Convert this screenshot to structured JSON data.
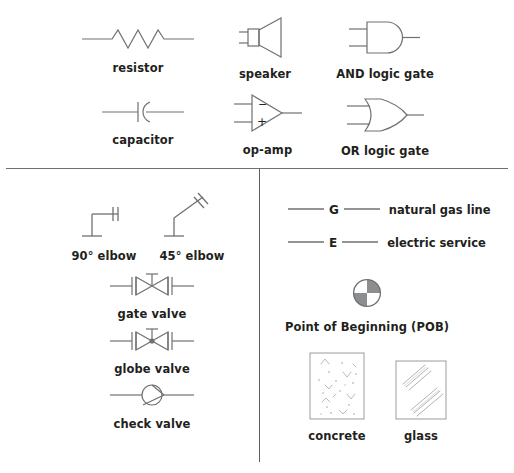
{
  "figure": {
    "stroke_color": "#6f7072",
    "text_color": "#231f20",
    "fill_gray": "#8d8e90",
    "background": "#ffffff"
  },
  "sections": {
    "electrical": {
      "name": "electrical symbols",
      "items": [
        {
          "id": "resistor",
          "label": "resistor",
          "icon": "resistor-symbol"
        },
        {
          "id": "speaker",
          "label": "speaker",
          "icon": "speaker-symbol"
        },
        {
          "id": "and_gate",
          "label": "AND logic gate",
          "icon": "and-gate-symbol"
        },
        {
          "id": "capacitor",
          "label": "capacitor",
          "icon": "capacitor-symbol"
        },
        {
          "id": "op_amp",
          "label": "op-amp",
          "icon": "op-amp-symbol"
        },
        {
          "id": "or_gate",
          "label": "OR logic gate",
          "icon": "or-gate-symbol"
        }
      ],
      "op_amp_pins": {
        "inverting": "−",
        "non_inverting": "+"
      }
    },
    "plumbing": {
      "name": "plumbing symbols",
      "items": [
        {
          "id": "elbow_90",
          "label": "90° elbow",
          "icon": "elbow-90-symbol"
        },
        {
          "id": "elbow_45",
          "label": "45° elbow",
          "icon": "elbow-45-symbol"
        },
        {
          "id": "gate_valve",
          "label": "gate valve",
          "icon": "gate-valve-symbol"
        },
        {
          "id": "globe_valve",
          "label": "globe valve",
          "icon": "globe-valve-symbol"
        },
        {
          "id": "check_valve",
          "label": "check valve",
          "icon": "check-valve-symbol"
        }
      ]
    },
    "site": {
      "name": "site and material symbols",
      "utility_lines": [
        {
          "id": "gas",
          "letter": "G",
          "label": "natural gas line",
          "icon": "utility-line-symbol"
        },
        {
          "id": "electric",
          "letter": "E",
          "label": "electric service",
          "icon": "utility-line-symbol"
        }
      ],
      "point_of_beginning": {
        "id": "pob",
        "label": "Point of Beginning (POB)",
        "icon": "point-of-beginning-symbol",
        "quadrants": [
          "white",
          "gray",
          "white",
          "gray"
        ]
      },
      "materials": [
        {
          "id": "concrete",
          "label": "concrete",
          "icon": "concrete-hatch-symbol"
        },
        {
          "id": "glass",
          "label": "glass",
          "icon": "glass-hatch-symbol"
        }
      ]
    }
  }
}
